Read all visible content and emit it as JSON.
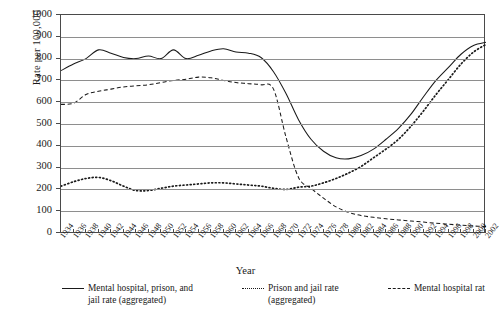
{
  "chart_data": {
    "type": "line",
    "title": "",
    "xlabel": "Year",
    "ylabel": "Rate per 100,000",
    "ylim": [
      0,
      1000
    ],
    "ytick_step": 100,
    "xlim": [
      1934,
      2002
    ],
    "xtick_step": 2,
    "grid": "horizontal",
    "legend_position": "bottom",
    "yticks": [
      "0",
      "100",
      "200",
      "300",
      "400",
      "500",
      "600",
      "700",
      "800",
      "900",
      "1000"
    ],
    "categories": [
      1934,
      1936,
      1938,
      1940,
      1942,
      1944,
      1946,
      1948,
      1950,
      1952,
      1954,
      1956,
      1958,
      1960,
      1962,
      1964,
      1966,
      1968,
      1970,
      1972,
      1974,
      1976,
      1978,
      1980,
      1982,
      1984,
      1986,
      1988,
      1990,
      1992,
      1994,
      1996,
      1998,
      2000,
      2002
    ],
    "xticklabels": [
      "1934",
      "1936",
      "1938",
      "1940",
      "1942",
      "1944",
      "1946",
      "1948",
      "1950",
      "1952",
      "1954",
      "1956",
      "1958",
      "1960",
      "1962",
      "1964",
      "1966",
      "1968",
      "1970",
      "1972",
      "1974",
      "1976",
      "1978",
      "1980",
      "1982",
      "1984",
      "1986",
      "1988",
      "1990",
      "1992",
      "1994",
      "1996",
      "1998",
      "2000",
      "2002"
    ],
    "series": [
      {
        "name": "Mental hospital, prison, and jail rate (aggregated)",
        "style": "solid",
        "color": "#1a1a1a",
        "values": [
          745,
          775,
          800,
          840,
          825,
          805,
          800,
          812,
          800,
          840,
          800,
          815,
          835,
          845,
          830,
          825,
          805,
          740,
          640,
          520,
          430,
          375,
          345,
          340,
          355,
          385,
          430,
          480,
          545,
          625,
          700,
          760,
          820,
          860,
          875
        ]
      },
      {
        "name": "Prison and jail rate (aggregated)",
        "style": "dotted",
        "color": "#1a1a1a",
        "values": [
          215,
          235,
          250,
          255,
          240,
          215,
          195,
          195,
          205,
          215,
          220,
          225,
          230,
          230,
          225,
          220,
          215,
          205,
          200,
          210,
          215,
          230,
          250,
          275,
          305,
          345,
          385,
          430,
          490,
          560,
          635,
          705,
          775,
          830,
          865
        ]
      },
      {
        "name": "Mental hospital rate",
        "style": "dashed",
        "color": "#1a1a1a",
        "values": [
          590,
          595,
          635,
          650,
          660,
          670,
          675,
          680,
          690,
          700,
          705,
          715,
          712,
          700,
          690,
          685,
          680,
          660,
          440,
          255,
          205,
          160,
          120,
          95,
          80,
          72,
          65,
          60,
          55,
          50,
          45,
          40,
          36,
          32,
          30
        ]
      }
    ]
  },
  "axis": {
    "ylabel": "Rate per 100,000",
    "xlabel": "Year"
  },
  "legend": {
    "items": [
      {
        "line1": "Mental hospital, prison, and",
        "line2": "jail rate (aggregated)",
        "style": "solid"
      },
      {
        "line1": "Prison and jail rate",
        "line2": "(aggregated)",
        "style": "dotted"
      },
      {
        "line1": "Mental hospital rat",
        "line2": "",
        "style": "dashed"
      }
    ]
  }
}
